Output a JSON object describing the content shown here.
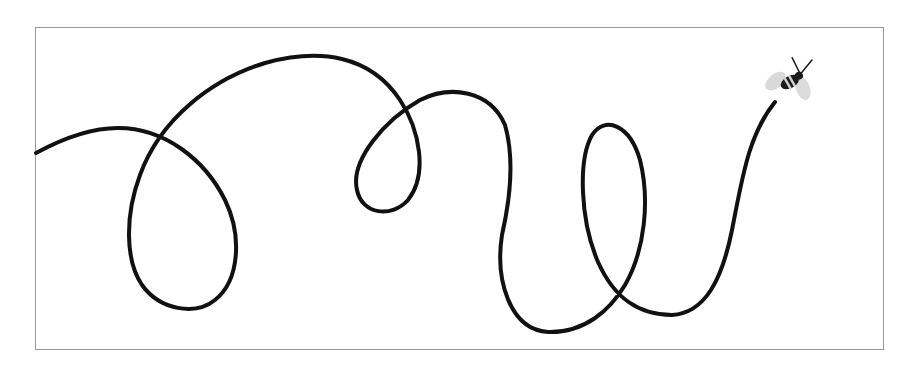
{
  "illustration": {
    "subject": "bee flying along a looping trail",
    "frame_color": "#9a9a9a",
    "line_color": "#111111",
    "bee": {
      "wing_color": "#d9d9d9",
      "body_color": "#1a1a1a",
      "stripe_color": "#cfcfcf"
    }
  }
}
